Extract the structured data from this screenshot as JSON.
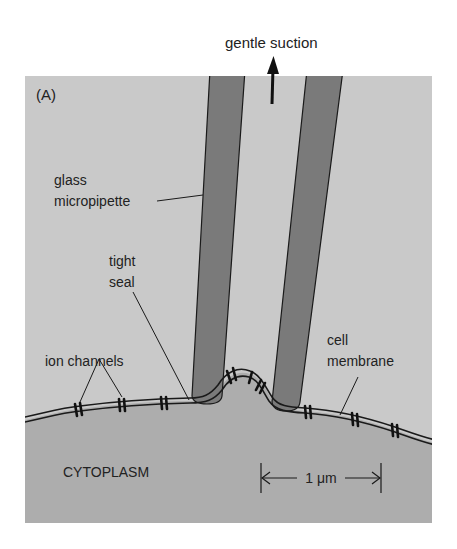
{
  "figure": {
    "panel_label": "(A)",
    "labels": {
      "suction": "gentle suction",
      "pipette_line1": "glass",
      "pipette_line2": "micropipette",
      "seal_line1": "tight",
      "seal_line2": "seal",
      "channels": "ion channels",
      "membrane_line1": "cell",
      "membrane_line2": "membrane",
      "cytoplasm": "CYTOPLASM",
      "scale": "1 μm"
    },
    "colors": {
      "background": "#ffffff",
      "extracellular": "#c9c9c9",
      "cytoplasm": "#adadad",
      "pipette": "#7a7a7a",
      "outline": "#1a1a1a"
    }
  }
}
